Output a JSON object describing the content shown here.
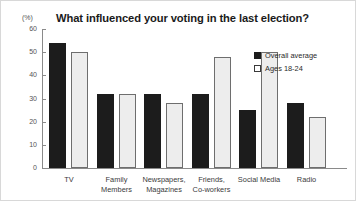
{
  "chart_data": {
    "type": "bar",
    "title": "What influenced your voting in the last election?",
    "xlabel": "",
    "ylabel": "(%)",
    "ylim": [
      0,
      60
    ],
    "yticks": [
      0,
      10,
      20,
      30,
      40,
      50,
      60
    ],
    "grid": false,
    "legend_position": "top-right",
    "categories": [
      "TV",
      "Family Members",
      "Newspapers, Magazines",
      "Friends, Co-workers",
      "Social Media",
      "Radio"
    ],
    "category_lines": [
      [
        "TV"
      ],
      [
        "Family",
        "Members"
      ],
      [
        "Newspapers,",
        "Magazines"
      ],
      [
        "Friends,",
        "Co-workers"
      ],
      [
        "Social Media"
      ],
      [
        "Radio"
      ]
    ],
    "series": [
      {
        "name": "Overall average",
        "color": "#1c1c1c",
        "values": [
          54,
          32,
          32,
          32,
          25,
          28
        ]
      },
      {
        "name": "Ages 18-24",
        "color": "#ededed",
        "values": [
          50,
          32,
          28,
          48,
          50,
          22
        ]
      }
    ]
  },
  "legend": {
    "items": [
      {
        "label": "Overall average",
        "style": "dark"
      },
      {
        "label": "Ages 18-24",
        "style": "light"
      }
    ]
  }
}
